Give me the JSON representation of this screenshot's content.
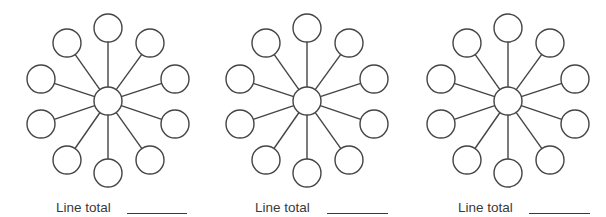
{
  "style": {
    "stroke": "#444444",
    "fill": "#ffffff",
    "stroke_width": 1.4,
    "hub_radius": 14,
    "node_radius": 14
  },
  "node_offsets": [
    {
      "name": "top",
      "dx": 0,
      "dy": -73
    },
    {
      "name": "upper-right",
      "dx": 42,
      "dy": -58
    },
    {
      "name": "right",
      "dx": 67,
      "dy": -22
    },
    {
      "name": "lower-right",
      "dx": 67,
      "dy": 23
    },
    {
      "name": "bottom-right",
      "dx": 42,
      "dy": 59
    },
    {
      "name": "bottom",
      "dx": 0,
      "dy": 72
    },
    {
      "name": "bottom-left",
      "dx": -41,
      "dy": 59
    },
    {
      "name": "lower-left",
      "dx": -67,
      "dy": 23
    },
    {
      "name": "left",
      "dx": -67,
      "dy": -22
    },
    {
      "name": "upper-left",
      "dx": -41,
      "dy": -58
    }
  ],
  "diagrams": [
    {
      "hub": {
        "x": 108,
        "y": 101
      },
      "label": "Line total",
      "label_pos": {
        "x": 56,
        "y": 201
      },
      "blank": {
        "x": 127,
        "y": 213,
        "width": 60
      }
    },
    {
      "hub": {
        "x": 307,
        "y": 101
      },
      "label": "Line total",
      "label_pos": {
        "x": 255,
        "y": 201
      },
      "blank": {
        "x": 327,
        "y": 213,
        "width": 61
      }
    },
    {
      "hub": {
        "x": 508,
        "y": 101
      },
      "label": "Line total",
      "label_pos": {
        "x": 458,
        "y": 201
      },
      "blank": {
        "x": 529,
        "y": 213,
        "width": 61
      }
    }
  ]
}
